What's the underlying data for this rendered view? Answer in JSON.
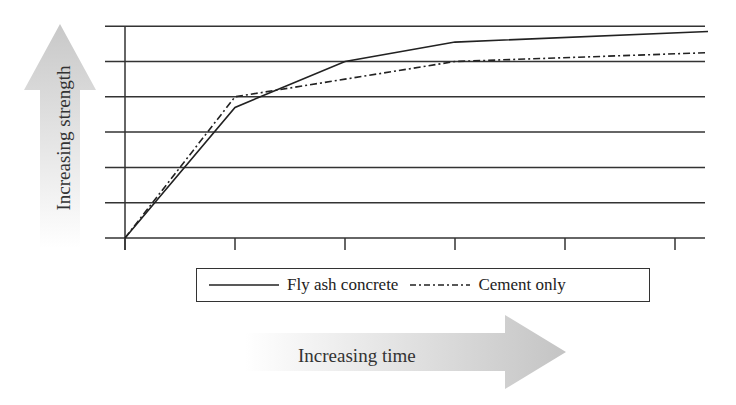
{
  "chart_data": {
    "type": "line",
    "title": "",
    "xlabel": "Increasing time",
    "ylabel": "Increasing strength",
    "x": [
      0,
      1,
      2,
      3,
      4,
      5,
      5.3
    ],
    "xticks": [
      0,
      1,
      2,
      3,
      4,
      5
    ],
    "xtick_labels": [
      "",
      "",
      "",
      "",
      "",
      ""
    ],
    "ylim": [
      0,
      6
    ],
    "yticks": [
      0,
      1,
      2,
      3,
      4,
      5,
      6
    ],
    "ytick_labels": [
      "",
      "",
      "",
      "",
      "",
      "",
      ""
    ],
    "grid": "horizontal",
    "legend_position": "bottom",
    "series": [
      {
        "name": "Fly ash concrete",
        "style": "solid",
        "points": [
          [
            0,
            0
          ],
          [
            1,
            3.7
          ],
          [
            2,
            5
          ],
          [
            3,
            5.55
          ],
          [
            5.3,
            5.85
          ]
        ]
      },
      {
        "name": "Cement only",
        "style": "dash-dot",
        "points": [
          [
            0,
            0
          ],
          [
            1,
            4.0
          ],
          [
            2,
            4.5
          ],
          [
            3,
            5.0
          ],
          [
            5.3,
            5.25
          ]
        ]
      }
    ]
  },
  "legend": {
    "items": [
      {
        "label": "Fly ash concrete",
        "style": "solid"
      },
      {
        "label": "Cement only",
        "style": "dash-dot"
      }
    ]
  },
  "axes": {
    "x_arrow_label": "Increasing time",
    "y_arrow_label": "Increasing strength"
  },
  "colors": {
    "line": "#222222",
    "grid": "#333333",
    "arrow": "#cfcfcf"
  }
}
